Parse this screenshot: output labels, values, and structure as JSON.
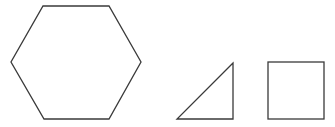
{
  "diagram": {
    "stroke_color": "#3a3a3a",
    "background": "#ffffff",
    "shapes": [
      {
        "name": "hexagon",
        "points": "43,6 109,6 141,62 109,119 44,119 11,62"
      },
      {
        "name": "right-triangle",
        "points": "233,63 177,119 233,119"
      },
      {
        "name": "square",
        "x": 268,
        "y": 62,
        "width": 56,
        "height": 57
      }
    ]
  }
}
